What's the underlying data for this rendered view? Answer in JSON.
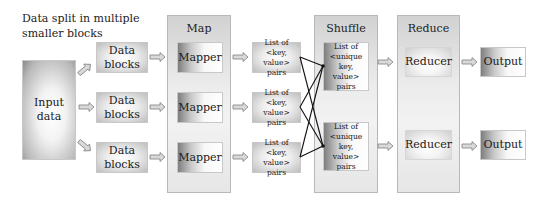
{
  "caption": {
    "line1": "Data split in multiple",
    "line2": "smaller blocks"
  },
  "input": {
    "label": "Input data"
  },
  "data_blocks": [
    {
      "line1": "Data",
      "line2": "blocks"
    },
    {
      "line1": "Data",
      "line2": "blocks"
    },
    {
      "line1": "Data",
      "line2": "blocks"
    }
  ],
  "stages": {
    "map": {
      "title": "Map",
      "items": [
        "Mapper",
        "Mapper",
        "Mapper"
      ]
    },
    "kv": [
      {
        "line1": "List of <key,",
        "line2": "value> pairs"
      },
      {
        "line1": "List of <key,",
        "line2": "value> pairs"
      },
      {
        "line1": "List of <key,",
        "line2": "value> pairs"
      }
    ],
    "shuffle": {
      "title": "Shuffle",
      "items": [
        {
          "line1": "List of",
          "line2": "<unique key,",
          "line3": "value> pairs"
        },
        {
          "line1": "List of",
          "line2": "<unique key,",
          "line3": "value> pairs"
        }
      ]
    },
    "reduce": {
      "title": "Reduce",
      "items": [
        "Reducer",
        "Reducer"
      ]
    },
    "outputs": [
      "Output",
      "Output"
    ]
  },
  "colors": {
    "arrow_fill": "#d9d9d9",
    "arrow_stroke": "#8a8a8a",
    "line": "#111111"
  }
}
